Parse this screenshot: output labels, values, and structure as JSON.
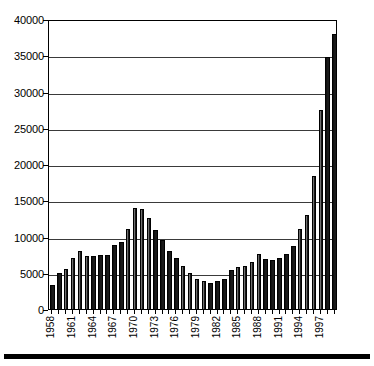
{
  "chart_data": {
    "type": "bar",
    "title": "",
    "subtitle": "",
    "xlabel": "",
    "ylabel": "",
    "ylim": [
      0,
      40000
    ],
    "ytick_values": [
      0,
      5000,
      10000,
      15000,
      20000,
      25000,
      30000,
      35000,
      40000
    ],
    "ytick_labels": [
      "0",
      "5000",
      "10000",
      "15000",
      "20000",
      "25000",
      "30000",
      "35000",
      "40000"
    ],
    "grid": true,
    "legend": null,
    "legend_position": "none",
    "annotations": [],
    "bar_color": "#1a1a1a",
    "xtick_label_interval": 3,
    "xtick_labels_shown": [
      "1958",
      "1961",
      "1964",
      "1967",
      "1970",
      "1973",
      "1976",
      "1979",
      "1982",
      "1985",
      "1988",
      "1991",
      "1994",
      "1997"
    ],
    "categories": [
      "1958",
      "1959",
      "1960",
      "1961",
      "1962",
      "1963",
      "1964",
      "1965",
      "1966",
      "1967",
      "1968",
      "1969",
      "1970",
      "1971",
      "1972",
      "1973",
      "1974",
      "1975",
      "1976",
      "1977",
      "1978",
      "1979",
      "1980",
      "1981",
      "1982",
      "1983",
      "1984",
      "1985",
      "1986",
      "1987",
      "1988",
      "1989",
      "1990",
      "1991",
      "1992",
      "1993",
      "1994",
      "1995",
      "1996",
      "1997",
      "1998"
    ],
    "values": [
      3300,
      4900,
      5500,
      7100,
      8000,
      7300,
      7300,
      7400,
      7500,
      8800,
      9300,
      11100,
      13900,
      13800,
      12600,
      10900,
      9500,
      8000,
      7100,
      5900,
      4900,
      4200,
      3900,
      3600,
      3900,
      4200,
      5400,
      5800,
      6000,
      6500,
      7600,
      6900,
      6800,
      7000,
      7600,
      8700,
      11100,
      13000,
      18400,
      27500,
      34700
    ],
    "last_value": 38000
  }
}
